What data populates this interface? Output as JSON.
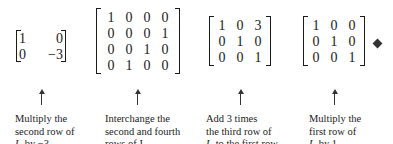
{
  "matrices": [
    {
      "rows": [
        [
          "1",
          "0"
        ],
        [
          "0",
          "−3"
        ]
      ]
    },
    {
      "rows": [
        [
          "1",
          "0",
          "0",
          "0"
        ],
        [
          "0",
          "0",
          "0",
          "1"
        ],
        [
          "0",
          "0",
          "1",
          "0"
        ],
        [
          "0",
          "1",
          "0",
          "0"
        ]
      ]
    },
    {
      "rows": [
        [
          "1",
          "0",
          "3"
        ],
        [
          "0",
          "1",
          "0"
        ],
        [
          "0",
          "0",
          "1"
        ]
      ]
    },
    {
      "rows": [
        [
          "1",
          "0",
          "0"
        ],
        [
          "0",
          "1",
          "0"
        ],
        [
          "0",
          "0",
          "1"
        ]
      ]
    }
  ],
  "captions": [
    {
      "line1": "Multiply the",
      "line2": "second row of",
      "line3_pre": "I",
      "line3_sub": "2",
      "line3_post": " by −3."
    },
    {
      "line1": "Interchange the",
      "line2": "second and fourth",
      "line3_pre": "rows of I",
      "line3_sub": "4",
      "line3_post": "."
    },
    {
      "line1": "Add 3 times",
      "line2": "the third row of",
      "line3_pre": "I",
      "line3_sub": "3",
      "line3_post": " to the first row."
    },
    {
      "line1": "Multiply the",
      "line2": "first row of",
      "line3_pre": "I",
      "line3_sub": "3",
      "line3_post": " by 1."
    }
  ],
  "end_marker": "diamond-icon"
}
